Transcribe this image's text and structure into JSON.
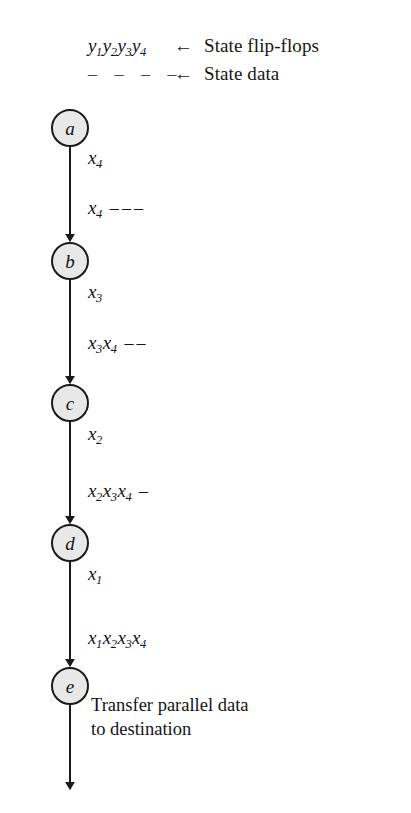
{
  "figure": {
    "type": "state-sequence-chain",
    "node_fill": "#e8e8e8",
    "node_stroke": "#1a1a1a",
    "line_color": "#1a1a1a",
    "background": "#ffffff"
  },
  "legend": {
    "arrow_glyph": "←",
    "rows": [
      {
        "symbol_html": "y1y2y3y4",
        "symbol_parts": [
          {
            "base": "y",
            "sub": "1"
          },
          {
            "base": "y",
            "sub": "2"
          },
          {
            "base": "y",
            "sub": "3"
          },
          {
            "base": "y",
            "sub": "4"
          }
        ],
        "label": "State flip-flops"
      },
      {
        "symbol_html": "– – – –",
        "dashes": 4,
        "label": "State data"
      }
    ]
  },
  "nodes": [
    {
      "id": "a",
      "label": "a",
      "cx": 70,
      "cy": 128,
      "r": 18
    },
    {
      "id": "b",
      "label": "b",
      "cx": 70,
      "cy": 261,
      "r": 18
    },
    {
      "id": "c",
      "label": "c",
      "cx": 70,
      "cy": 403,
      "r": 18
    },
    {
      "id": "d",
      "label": "d",
      "cx": 70,
      "cy": 543,
      "r": 18
    },
    {
      "id": "e",
      "label": "e",
      "cx": 70,
      "cy": 686,
      "r": 18
    }
  ],
  "edges": [
    {
      "from": "a",
      "to": "b",
      "input_label": {
        "parts": [
          {
            "base": "x",
            "sub": "4"
          }
        ]
      },
      "state_label": {
        "parts": [
          {
            "base": "x",
            "sub": "4"
          }
        ],
        "dashes": 3
      }
    },
    {
      "from": "b",
      "to": "c",
      "input_label": {
        "parts": [
          {
            "base": "x",
            "sub": "3"
          }
        ]
      },
      "state_label": {
        "parts": [
          {
            "base": "x",
            "sub": "3"
          },
          {
            "base": "x",
            "sub": "4"
          }
        ],
        "dashes": 2
      }
    },
    {
      "from": "c",
      "to": "d",
      "input_label": {
        "parts": [
          {
            "base": "x",
            "sub": "2"
          }
        ]
      },
      "state_label": {
        "parts": [
          {
            "base": "x",
            "sub": "2"
          },
          {
            "base": "x",
            "sub": "3"
          },
          {
            "base": "x",
            "sub": "4"
          }
        ],
        "dashes": 1
      }
    },
    {
      "from": "d",
      "to": "e",
      "input_label": {
        "parts": [
          {
            "base": "x",
            "sub": "1"
          }
        ]
      },
      "state_label": {
        "parts": [
          {
            "base": "x",
            "sub": "1"
          },
          {
            "base": "x",
            "sub": "2"
          },
          {
            "base": "x",
            "sub": "3"
          },
          {
            "base": "x",
            "sub": "4"
          }
        ],
        "dashes": 0
      }
    }
  ],
  "exit": {
    "caption": "Transfer parallel data\nto destination"
  },
  "labels": {
    "edge_a_input": "x4",
    "edge_a_state": "x4 – – –",
    "edge_b_input": "x3",
    "edge_b_state": "x3x4 – –",
    "edge_c_input": "x2",
    "edge_c_state": "x2x3x4 –",
    "edge_d_input": "x1",
    "edge_d_state": "x1x2x3x4"
  }
}
